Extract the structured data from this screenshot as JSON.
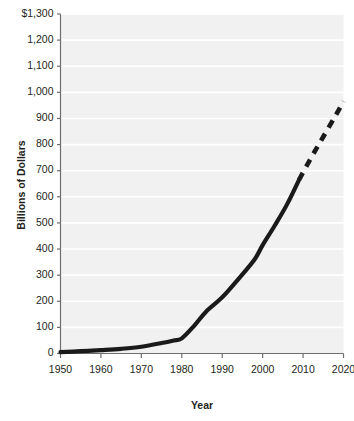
{
  "chart_data": {
    "type": "line",
    "title": "",
    "subtitle": "",
    "xlabel": "Year",
    "ylabel": "Billions of Dollars",
    "xlim": [
      1950,
      2020
    ],
    "ylim": [
      0,
      1300
    ],
    "grid": true,
    "grid_orientation": "horizontal",
    "legend": false,
    "legend_position": "none",
    "x_tick_labels": [
      "1950",
      "1960",
      "1970",
      "1980",
      "1990",
      "2000",
      "2010",
      "2020"
    ],
    "x_ticks": [
      1950,
      1960,
      1970,
      1980,
      1990,
      2000,
      2010,
      2020
    ],
    "y_tick_labels": [
      "0",
      "100",
      "200",
      "300",
      "400",
      "500",
      "600",
      "700",
      "800",
      "900",
      "1,000",
      "1,100",
      "1,200",
      "$1,300"
    ],
    "y_ticks": [
      0,
      100,
      200,
      300,
      400,
      500,
      600,
      700,
      800,
      900,
      1000,
      1100,
      1200,
      1300
    ],
    "series": [
      {
        "name": "Actual",
        "style": "solid",
        "color": "#1a1a1a",
        "x": [
          1950,
          1955,
          1960,
          1965,
          1970,
          1975,
          1978,
          1980,
          1983,
          1986,
          1990,
          1994,
          1998,
          2000,
          2003,
          2006,
          2009
        ],
        "values": [
          5,
          9,
          13,
          18,
          26,
          40,
          50,
          58,
          105,
          160,
          215,
          285,
          360,
          415,
          490,
          570,
          665
        ]
      },
      {
        "name": "Projected",
        "style": "dashed",
        "color": "#1a1a1a",
        "x": [
          2009,
          2012,
          2015,
          2018,
          2020
        ],
        "values": [
          665,
          750,
          830,
          910,
          965
        ]
      }
    ],
    "annotations": [
      {
        "text": "dashed segment indicates projection beyond 2009",
        "visible": false
      }
    ],
    "colors": {
      "plot_background": "#f1f1f1",
      "page_background": "#ffffff",
      "gridline": "#ffffff",
      "axis": "#6d6e71",
      "line": "#1a1a1a",
      "text": "#231f20"
    }
  },
  "axis_titles": {
    "x": "Year",
    "y": "Billions of Dollars"
  }
}
